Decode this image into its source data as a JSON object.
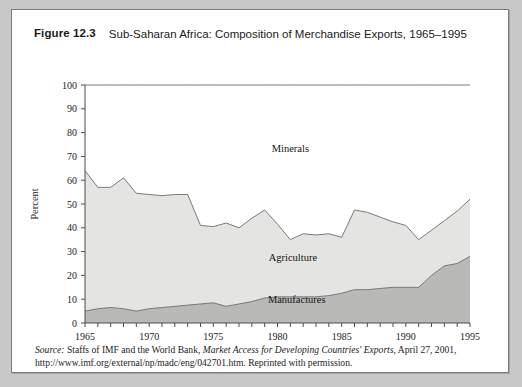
{
  "figure": {
    "number": "Figure 12.3",
    "title": "Sub-Saharan Africa: Composition of Merchandise Exports, 1965–1995"
  },
  "source_note": {
    "label": "Source:",
    "text_before_work": " Staffs of IMF and the World Bank, ",
    "work": "Market Access for Developing Countries' Exports",
    "text_after_work": ", April 27, 2001, http://www.imf.org/external/np/madc/eng/042701.htm. Reprinted with permission."
  },
  "colors": {
    "minerals_fill": "#ffffff",
    "agriculture_fill": "#e4e4e2",
    "manufactures_fill": "#b9b9b7",
    "outline": "#6b6b6b",
    "axis": "#4a4a4a",
    "card_background": "#ffffff",
    "page_background": "#c8c8c8",
    "border": "#7d7d7d"
  },
  "chart_data": {
    "type": "area",
    "stacked": true,
    "title": "Sub-Saharan Africa: Composition of Merchandise Exports, 1965–1995",
    "xlabel": "",
    "ylabel": "Percent",
    "xlim": [
      1965,
      1995
    ],
    "ylim": [
      0,
      100
    ],
    "ytick_step": 10,
    "yticks": [
      0,
      10,
      20,
      30,
      40,
      50,
      60,
      70,
      80,
      90,
      100
    ],
    "xticks_labeled": [
      1965,
      1970,
      1975,
      1980,
      1985,
      1990,
      1995
    ],
    "xtick_minor_step": 1,
    "grid": false,
    "legend": "inline-area-labels",
    "x": [
      1965,
      1966,
      1967,
      1968,
      1969,
      1970,
      1971,
      1972,
      1973,
      1974,
      1975,
      1976,
      1977,
      1978,
      1979,
      1980,
      1981,
      1982,
      1983,
      1984,
      1985,
      1986,
      1987,
      1988,
      1989,
      1990,
      1991,
      1992,
      1993,
      1994,
      1995
    ],
    "series": [
      {
        "name": "Manufactures",
        "fill": "#b9b9b7",
        "stack_order": 1,
        "values": [
          5,
          6,
          6.5,
          6,
          5,
          6,
          6.5,
          7,
          7.5,
          8,
          8.5,
          7,
          8,
          9,
          10.5,
          11,
          11,
          11,
          11,
          11.5,
          12.5,
          14,
          14,
          14.5,
          15,
          15,
          15,
          20,
          24,
          25,
          28
        ]
      },
      {
        "name": "Agriculture",
        "fill": "#e4e4e2",
        "stack_order": 2,
        "values": [
          59,
          51,
          50.5,
          55,
          49.5,
          48,
          47,
          47,
          46.5,
          33,
          32,
          35,
          32,
          35,
          37,
          30.5,
          24,
          26.5,
          26,
          26,
          23.5,
          33.5,
          32.5,
          30,
          27.5,
          26,
          20,
          19,
          19,
          22,
          24
        ]
      },
      {
        "name": "Minerals",
        "fill": "#ffffff",
        "stack_order": 3,
        "values": [
          36,
          43,
          43,
          39,
          45.5,
          46,
          46.5,
          46,
          46,
          59,
          59.5,
          58,
          60,
          56,
          52.5,
          58.5,
          65,
          62.5,
          63,
          62.5,
          64,
          52.5,
          53.5,
          55.5,
          57.5,
          59,
          65,
          61,
          57,
          53,
          48
        ]
      }
    ],
    "stacked_tops": {
      "manufactures": [
        5,
        6,
        6.5,
        6,
        5,
        6,
        6.5,
        7,
        7.5,
        8,
        8.5,
        7,
        8,
        9,
        10.5,
        11,
        11,
        11,
        11,
        11.5,
        12.5,
        14,
        14,
        14.5,
        15,
        15,
        15,
        20,
        24,
        25,
        28
      ],
      "agriculture": [
        64,
        57,
        57,
        61,
        54.5,
        53,
        53.5,
        54,
        54,
        41,
        40.5,
        42,
        40,
        44,
        47.5,
        41.5,
        35,
        37.5,
        37,
        37.5,
        36,
        47.5,
        46.5,
        44.5,
        42.5,
        41,
        35,
        39,
        43,
        47,
        52
      ]
    },
    "area_labels": [
      {
        "name": "Minerals",
        "x": 1981,
        "y": 72
      },
      {
        "name": "Agriculture",
        "x": 1981.2,
        "y": 26
      },
      {
        "name": "Manufactures",
        "x": 1981.5,
        "y": 8.5
      }
    ]
  }
}
